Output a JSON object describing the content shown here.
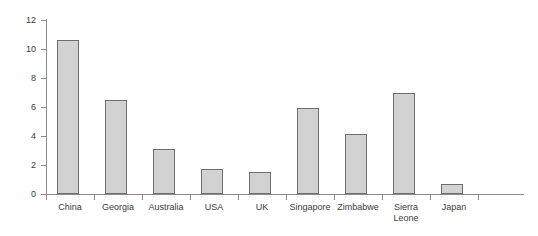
{
  "chart_data": {
    "type": "bar",
    "title": "",
    "subtitle": "",
    "xlabel": "",
    "ylabel": "",
    "categories": [
      "China",
      "Georgia",
      "Australia",
      "USA",
      "UK",
      "Singapore",
      "Zimbabwe",
      "Sierra Leone",
      "Japan"
    ],
    "values": [
      10.6,
      6.45,
      3.1,
      1.75,
      1.55,
      5.9,
      4.15,
      6.95,
      0.7
    ],
    "ylim": [
      0,
      12
    ],
    "ytick_labels": [
      "0",
      "2",
      "4",
      "6",
      "8",
      "10",
      "12"
    ],
    "ytick_values": [
      0,
      2,
      4,
      6,
      8,
      10,
      12
    ],
    "grid": false,
    "legend": null,
    "legend_position": "none",
    "bar_fill_color": "#d2d2d2",
    "bar_border_color": "#6e6e6e",
    "axis_color": "#8c8c8c",
    "text_color": "#3a3a3a",
    "background_color": "#ffffff"
  },
  "labels": {
    "category_display": [
      "China",
      "Georgia",
      "Australia",
      "USA",
      "UK",
      "Singapore",
      "Zimbabwe",
      "Sierra\nLeone",
      "Japan"
    ]
  }
}
